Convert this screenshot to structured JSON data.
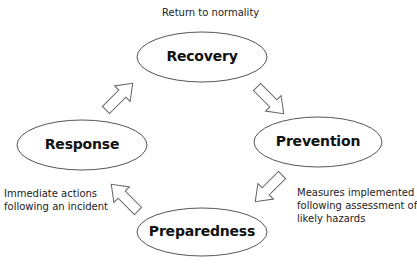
{
  "diagram": {
    "type": "cycle",
    "nodes": [
      {
        "id": "recovery",
        "label": "Recovery",
        "cx": 202,
        "cy": 57,
        "rx": 65,
        "ry": 25
      },
      {
        "id": "prevention",
        "label": "Prevention",
        "cx": 318,
        "cy": 142,
        "rx": 64,
        "ry": 25
      },
      {
        "id": "preparedness",
        "label": "Preparedness",
        "cx": 202,
        "cy": 232,
        "rx": 65,
        "ry": 24
      },
      {
        "id": "response",
        "label": "Response",
        "cx": 82,
        "cy": 145,
        "rx": 65,
        "ry": 25
      }
    ],
    "edges": [
      {
        "from": "recovery",
        "to": "prevention"
      },
      {
        "from": "prevention",
        "to": "preparedness"
      },
      {
        "from": "preparedness",
        "to": "response"
      },
      {
        "from": "response",
        "to": "recovery"
      }
    ],
    "annotations": {
      "recovery": "Return to normality",
      "response_line1": "Immediate actions",
      "response_line2": "following an incident",
      "prevention_line1": "Measures implemented",
      "prevention_line2": "following assessment of",
      "prevention_line3": "likely hazards"
    },
    "colors": {
      "stroke": "#555555",
      "fill": "#ffffff",
      "text": "#111111"
    }
  }
}
